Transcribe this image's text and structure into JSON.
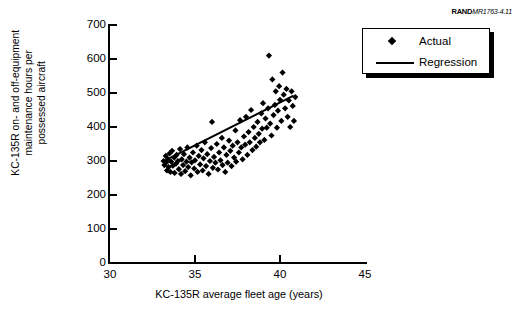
{
  "credit": {
    "brand": "RAND",
    "document_id": "MR1763-4.11"
  },
  "legend": {
    "position": "top-right",
    "entries": [
      {
        "label": "Actual",
        "marker": "diamond"
      },
      {
        "label": "Regression",
        "marker": "line"
      }
    ]
  },
  "chart_data": {
    "type": "scatter",
    "title": "",
    "xlabel": "KC-135R average fleet age (years)",
    "ylabel": "KC-135R on- and off-equipment maintenance hours per possessed aircraft",
    "ylabel_lines": [
      "KC-135R on- and off-equipment",
      "maintenance hours per",
      "possessed aircraft"
    ],
    "xlim": [
      30,
      45
    ],
    "ylim": [
      0,
      700
    ],
    "xticks": [
      30,
      35,
      40,
      45
    ],
    "yticks": [
      0,
      100,
      200,
      300,
      400,
      500,
      600,
      700
    ],
    "grid": false,
    "marker_color": "#000000",
    "line_color": "#000000",
    "series": [
      {
        "name": "Actual",
        "type": "scatter",
        "points": [
          [
            33.15,
            300
          ],
          [
            33.2,
            288
          ],
          [
            33.28,
            315
          ],
          [
            33.3,
            295
          ],
          [
            33.35,
            272
          ],
          [
            33.4,
            305
          ],
          [
            33.45,
            282
          ],
          [
            33.5,
            322
          ],
          [
            33.55,
            268
          ],
          [
            33.6,
            298
          ],
          [
            33.65,
            330
          ],
          [
            33.7,
            286
          ],
          [
            33.78,
            310
          ],
          [
            33.8,
            265
          ],
          [
            33.88,
            292
          ],
          [
            33.92,
            318
          ],
          [
            34.0,
            300
          ],
          [
            34.05,
            276
          ],
          [
            34.12,
            335
          ],
          [
            34.18,
            262
          ],
          [
            34.22,
            305
          ],
          [
            34.3,
            288
          ],
          [
            34.35,
            320
          ],
          [
            34.42,
            270
          ],
          [
            34.5,
            298
          ],
          [
            34.55,
            340
          ],
          [
            34.6,
            282
          ],
          [
            34.68,
            310
          ],
          [
            34.75,
            258
          ],
          [
            34.8,
            296
          ],
          [
            34.88,
            325
          ],
          [
            34.95,
            278
          ],
          [
            35.0,
            302
          ],
          [
            35.1,
            345
          ],
          [
            35.15,
            268
          ],
          [
            35.22,
            315
          ],
          [
            35.3,
            290
          ],
          [
            35.38,
            332
          ],
          [
            35.45,
            272
          ],
          [
            35.5,
            308
          ],
          [
            35.58,
            355
          ],
          [
            35.65,
            285
          ],
          [
            35.72,
            320
          ],
          [
            35.8,
            262
          ],
          [
            35.88,
            300
          ],
          [
            35.95,
            338
          ],
          [
            36.0,
            415
          ],
          [
            36.05,
            280
          ],
          [
            36.12,
            312
          ],
          [
            36.2,
            295
          ],
          [
            36.28,
            350
          ],
          [
            36.35,
            275
          ],
          [
            36.42,
            325
          ],
          [
            36.5,
            302
          ],
          [
            36.58,
            368
          ],
          [
            36.62,
            288
          ],
          [
            36.7,
            340
          ],
          [
            36.78,
            268
          ],
          [
            36.85,
            318
          ],
          [
            36.92,
            295
          ],
          [
            37.0,
            360
          ],
          [
            37.08,
            330
          ],
          [
            37.15,
            285
          ],
          [
            37.22,
            345
          ],
          [
            37.3,
            310
          ],
          [
            37.38,
            390
          ],
          [
            37.42,
            298
          ],
          [
            37.5,
            355
          ],
          [
            37.58,
            325
          ],
          [
            37.65,
            420
          ],
          [
            37.72,
            340
          ],
          [
            37.8,
            305
          ],
          [
            37.88,
            372
          ],
          [
            37.95,
            348
          ],
          [
            38.0,
            430
          ],
          [
            38.08,
            318
          ],
          [
            38.15,
            385
          ],
          [
            38.22,
            355
          ],
          [
            38.3,
            450
          ],
          [
            38.38,
            332
          ],
          [
            38.45,
            400
          ],
          [
            38.52,
            368
          ],
          [
            38.6,
            342
          ],
          [
            38.68,
            415
          ],
          [
            38.75,
            380
          ],
          [
            38.82,
            355
          ],
          [
            38.9,
            440
          ],
          [
            38.95,
            395
          ],
          [
            39.0,
            470
          ],
          [
            39.08,
            362
          ],
          [
            39.15,
            425
          ],
          [
            39.22,
            398
          ],
          [
            39.3,
            455
          ],
          [
            39.35,
            610
          ],
          [
            39.42,
            410
          ],
          [
            39.5,
            375
          ],
          [
            39.55,
            540
          ],
          [
            39.62,
            435
          ],
          [
            39.7,
            465
          ],
          [
            39.75,
            505
          ],
          [
            39.82,
            398
          ],
          [
            39.88,
            448
          ],
          [
            39.95,
            520
          ],
          [
            40.0,
            480
          ],
          [
            40.08,
            418
          ],
          [
            40.15,
            560
          ],
          [
            40.22,
            495
          ],
          [
            40.3,
            455
          ],
          [
            40.38,
            512
          ],
          [
            40.45,
            430
          ],
          [
            40.52,
            478
          ],
          [
            40.6,
            400
          ],
          [
            40.68,
            505
          ],
          [
            40.75,
            462
          ],
          [
            40.82,
            418
          ],
          [
            40.9,
            488
          ]
        ]
      },
      {
        "name": "Regression",
        "type": "line",
        "x": [
          33.3,
          40.8
        ],
        "y": [
          303,
          492
        ]
      }
    ]
  }
}
